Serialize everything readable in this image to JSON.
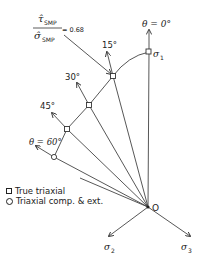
{
  "diagram": {
    "title_ratio": {
      "numerator": "τ̂",
      "numerator_sub": "SMP",
      "denominator": "σ̂",
      "denominator_sub": "SMP",
      "equals": "= 0.68"
    },
    "angles": [
      {
        "label": "θ = 0°"
      },
      {
        "label": "15°"
      },
      {
        "label": "30°"
      },
      {
        "label": "45°"
      },
      {
        "label": "θ = 60°"
      }
    ],
    "axes": {
      "sigma1": "σ",
      "sigma1_sub": "1",
      "sigma2": "σ",
      "sigma2_sub": "2",
      "sigma3": "σ",
      "sigma3_sub": "3",
      "origin": "O"
    },
    "legend": {
      "items": [
        {
          "symbol": "square",
          "label": "True triaxial"
        },
        {
          "symbol": "circle",
          "label": "Triaxial comp. & ext."
        }
      ]
    },
    "colors": {
      "line": "#333333",
      "background": "#ffffff"
    }
  }
}
